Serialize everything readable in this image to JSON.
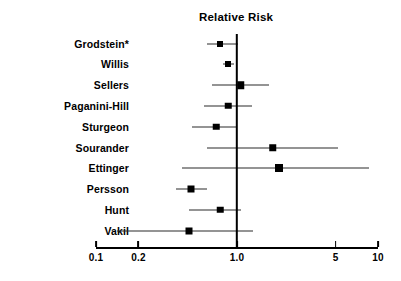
{
  "chart_data": {
    "type": "scatter",
    "subtype": "forest-plot",
    "title": "Relative Risk",
    "xlabel": "",
    "ylabel": "",
    "xscale": "log",
    "xlim": [
      0.1,
      10
    ],
    "grid": false,
    "legend": null,
    "null_value": 1.0,
    "xticks": [
      0.1,
      0.2,
      1.0,
      5,
      10
    ],
    "xticklabels": [
      "0.1",
      "0.2",
      "1.0",
      "5",
      "10"
    ],
    "categories": [
      "Grodstein*",
      "Willis",
      "Sellers",
      "Paganini-Hill",
      "Sturgeon",
      "Sourander",
      "Ettinger",
      "Persson",
      "Hunt",
      "Vakil"
    ],
    "values": [
      0.76,
      0.86,
      1.06,
      0.87,
      0.71,
      1.8,
      2.0,
      0.47,
      0.76,
      0.46
    ],
    "ci_low": [
      0.61,
      0.8,
      0.67,
      0.58,
      0.48,
      0.61,
      0.41,
      0.37,
      0.46,
      0.14
    ],
    "ci_high": [
      1.02,
      0.95,
      1.7,
      1.28,
      1.0,
      5.2,
      8.6,
      0.61,
      1.06,
      1.3
    ],
    "marker_sizes": [
      6,
      6,
      7.5,
      6.5,
      6.5,
      7.5,
      8,
      7,
      6.5,
      7
    ],
    "points": [
      {
        "label": "Grodstein*",
        "rr": 0.76,
        "low": 0.61,
        "high": 1.02
      },
      {
        "label": "Willis",
        "rr": 0.86,
        "low": 0.8,
        "high": 0.95
      },
      {
        "label": "Sellers",
        "rr": 1.06,
        "low": 0.67,
        "high": 1.7
      },
      {
        "label": "Paganini-Hill",
        "rr": 0.87,
        "low": 0.58,
        "high": 1.28
      },
      {
        "label": "Sturgeon",
        "rr": 0.71,
        "low": 0.48,
        "high": 1.0
      },
      {
        "label": "Sourander",
        "rr": 1.8,
        "low": 0.61,
        "high": 5.2
      },
      {
        "label": "Ettinger",
        "rr": 2.0,
        "low": 0.41,
        "high": 8.6
      },
      {
        "label": "Persson",
        "rr": 0.47,
        "low": 0.37,
        "high": 0.61
      },
      {
        "label": "Hunt",
        "rr": 0.76,
        "low": 0.46,
        "high": 1.06
      },
      {
        "label": "Vakil",
        "rr": 0.46,
        "low": 0.14,
        "high": 1.3
      }
    ]
  },
  "colors": {
    "marker": "#000000",
    "ci_line": "#2a2a2a",
    "axis": "#000000",
    "null_line": "#000000",
    "background": "#ffffff"
  },
  "footnote": ""
}
